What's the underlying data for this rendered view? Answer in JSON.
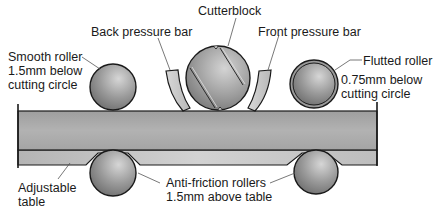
{
  "diagram": {
    "labels": {
      "cutterblock": "Cutterblock",
      "back_pressure_bar": "Back pressure bar",
      "front_pressure_bar": "Front pressure bar",
      "smooth_roller_line1": "Smooth roller",
      "smooth_roller_line2": "1.5mm below",
      "smooth_roller_line3": "cutting circle",
      "flutted_roller_line1": "Flutted roller",
      "flutted_roller_line2": "0.75mm below",
      "flutted_roller_line3": "cutting circle",
      "adjustable_table_line1": "Adjustable",
      "adjustable_table_line2": "table",
      "anti_friction_line1": "Anti-friction rollers",
      "anti_friction_line2": "1.5mm above table"
    },
    "colors": {
      "outline": "#1a1a1a",
      "workpiece": "#a9a9a9",
      "table": "#c4c4c4",
      "roller_light": "#cfcfcf",
      "roller_dark": "#7a7a7a",
      "pressure_bar": "#cdcdcd",
      "leader_line": "#555555"
    }
  }
}
